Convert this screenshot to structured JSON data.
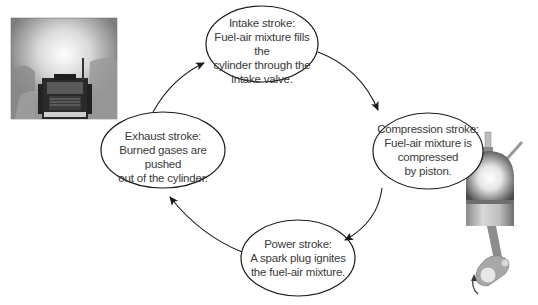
{
  "diagram": {
    "strokes": [
      {
        "id": "intake",
        "lines": [
          "Intake stroke:",
          "Fuel-air mixture fills the",
          "cylinder through the",
          "intake valve."
        ]
      },
      {
        "id": "compression",
        "lines": [
          "Compression stroke:",
          "Fuel-air mixture is",
          "compressed",
          "by piston."
        ]
      },
      {
        "id": "power",
        "lines": [
          "Power stroke:",
          "A spark plug ignites",
          "the fuel-air mixture."
        ]
      },
      {
        "id": "exhaust",
        "lines": [
          "Exhaust stroke:",
          "Burned gases are pushed",
          "out of the cylinder."
        ]
      }
    ],
    "flow_direction": "clockwise",
    "images": {
      "left": "truck-exhaust-photo",
      "right": "engine-cylinder-illustration"
    },
    "colors": {
      "outline": "#1a1a1a",
      "text": "#3a3a3a",
      "background": "#ffffff"
    }
  }
}
